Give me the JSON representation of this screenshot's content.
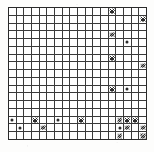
{
  "figure": {
    "kind": "grid-matrix",
    "title": "",
    "rows": 17,
    "cols": 18,
    "bounds": {
      "left": 8,
      "top": 7,
      "width": 139,
      "height": 133
    },
    "colors": {
      "background": "#ffffff",
      "page": "#fdfdfc",
      "gridline": "#3a3a3a",
      "border": "#2a2a2a",
      "fill": "#1c1c1c",
      "mark": "#2c2c2c"
    },
    "legend": {
      "empty": "empty cell",
      "fill": "solid filled cell",
      "mark": "cross-hatched cell",
      "dot": "dotted cell",
      "half": "half-toned cell"
    },
    "cells": [
      [
        "e",
        "e",
        "e",
        "e",
        "e",
        "e",
        "e",
        "e",
        "e",
        "e",
        "e",
        "e",
        "e",
        "m",
        "e",
        "e",
        "e",
        "e"
      ],
      [
        "e",
        "e",
        "e",
        "e",
        "e",
        "e",
        "e",
        "e",
        "e",
        "e",
        "e",
        "e",
        "e",
        "f",
        "e",
        "e",
        "e",
        "m"
      ],
      [
        "e",
        "e",
        "e",
        "e",
        "e",
        "e",
        "e",
        "e",
        "e",
        "e",
        "e",
        "e",
        "e",
        "e",
        "e",
        "f",
        "e",
        "e"
      ],
      [
        "e",
        "e",
        "e",
        "e",
        "e",
        "e",
        "e",
        "e",
        "e",
        "e",
        "e",
        "e",
        "e",
        "m",
        "e",
        "e",
        "e",
        "e"
      ],
      [
        "e",
        "e",
        "e",
        "e",
        "e",
        "e",
        "e",
        "e",
        "e",
        "e",
        "e",
        "e",
        "e",
        "e",
        "e",
        "d",
        "e",
        "e"
      ],
      [
        "e",
        "e",
        "e",
        "e",
        "e",
        "e",
        "e",
        "e",
        "e",
        "e",
        "e",
        "e",
        "e",
        "f",
        "e",
        "e",
        "e",
        "e"
      ],
      [
        "e",
        "e",
        "e",
        "e",
        "e",
        "e",
        "e",
        "e",
        "e",
        "e",
        "e",
        "e",
        "e",
        "m",
        "e",
        "e",
        "e",
        "e"
      ],
      [
        "e",
        "e",
        "e",
        "e",
        "e",
        "e",
        "e",
        "e",
        "e",
        "e",
        "e",
        "e",
        "e",
        "e",
        "e",
        "e",
        "e",
        "m"
      ],
      [
        "e",
        "e",
        "e",
        "e",
        "e",
        "e",
        "e",
        "e",
        "e",
        "e",
        "e",
        "e",
        "e",
        "f",
        "e",
        "e",
        "e",
        "e"
      ],
      [
        "e",
        "e",
        "e",
        "e",
        "e",
        "e",
        "e",
        "e",
        "e",
        "e",
        "e",
        "e",
        "e",
        "e",
        "e",
        "f",
        "e",
        "e"
      ],
      [
        "e",
        "e",
        "e",
        "e",
        "e",
        "e",
        "e",
        "e",
        "e",
        "e",
        "e",
        "e",
        "e",
        "m",
        "e",
        "d",
        "e",
        "e"
      ],
      [
        "e",
        "e",
        "e",
        "e",
        "e",
        "e",
        "e",
        "e",
        "e",
        "e",
        "e",
        "e",
        "f",
        "e",
        "e",
        "e",
        "e",
        "e"
      ],
      [
        "e",
        "e",
        "e",
        "e",
        "e",
        "e",
        "e",
        "e",
        "e",
        "e",
        "e",
        "e",
        "e",
        "f",
        "e",
        "e",
        "e",
        "e"
      ],
      [
        "e",
        "e",
        "e",
        "e",
        "e",
        "e",
        "e",
        "e",
        "e",
        "e",
        "e",
        "e",
        "e",
        "e",
        "e",
        "e",
        "e",
        "e"
      ],
      [
        "d",
        "e",
        "e",
        "m",
        "e",
        "e",
        "d",
        "e",
        "e",
        "m",
        "e",
        "e",
        "e",
        "e",
        "m",
        "m",
        "m",
        "e"
      ],
      [
        "e",
        "d",
        "f",
        "e",
        "m",
        "f",
        "e",
        "e",
        "f",
        "e",
        "e",
        "f",
        "h",
        "e",
        "d",
        "m",
        "e",
        "m"
      ],
      [
        "e",
        "e",
        "e",
        "f",
        "e",
        "e",
        "e",
        "f",
        "e",
        "e",
        "f",
        "e",
        "h",
        "e",
        "m",
        "e",
        "e",
        "m"
      ]
    ]
  }
}
